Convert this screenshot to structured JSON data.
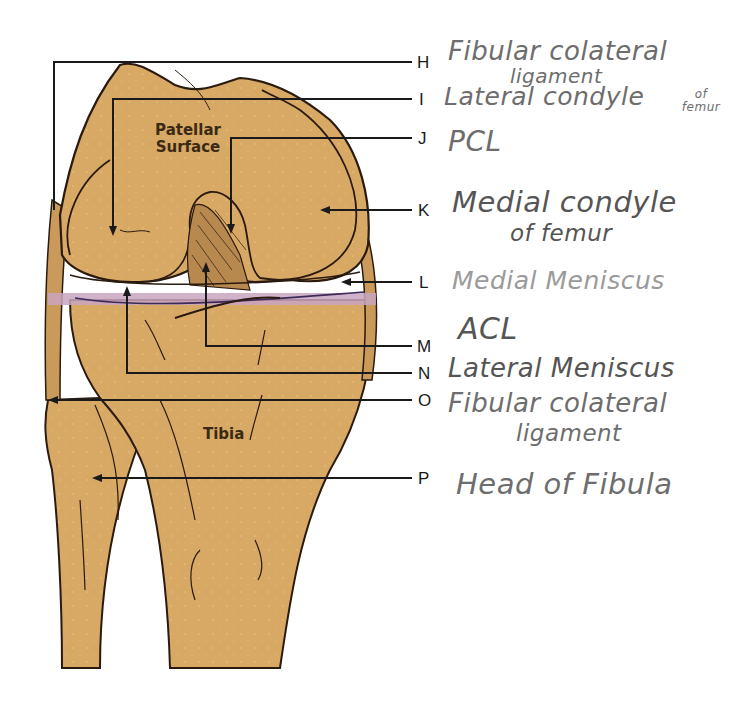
{
  "diagram": {
    "colors": {
      "bone": "#d8a865",
      "outline": "#2a1a10",
      "meniscus_band": "#c9a6c0",
      "leader_line": "#1a1a1a",
      "handwriting": "#6d6d6d"
    },
    "printed_labels": {
      "patellar_surface": [
        "Patellar",
        "Surface"
      ],
      "tibia": "Tibia"
    },
    "callouts": [
      {
        "letter": "H",
        "answer_lines": [
          "Fibular colateral",
          "ligament"
        ]
      },
      {
        "letter": "I",
        "answer_lines": [
          "Lateral condyle",
          "of femur"
        ]
      },
      {
        "letter": "J",
        "answer_lines": [
          "PCL"
        ]
      },
      {
        "letter": "K",
        "answer_lines": [
          "Medial condyle",
          "of femur"
        ]
      },
      {
        "letter": "L",
        "answer_lines": [
          "Medial Meniscus"
        ]
      },
      {
        "letter": "M",
        "answer_lines": [
          "ACL"
        ]
      },
      {
        "letter": "N",
        "answer_lines": [
          "Lateral Meniscus"
        ]
      },
      {
        "letter": "O",
        "answer_lines": [
          "Fibular colateral",
          "ligament"
        ]
      },
      {
        "letter": "P",
        "answer_lines": [
          "Head of Fibula"
        ]
      }
    ]
  }
}
